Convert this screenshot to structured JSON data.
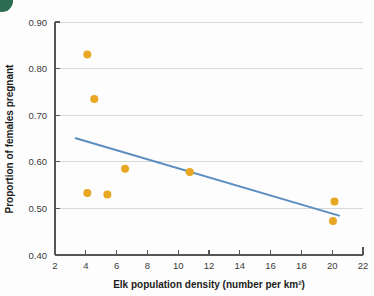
{
  "figure": {
    "corner_marker_color": "#2e6b53",
    "background_color": "#fdfdfd"
  },
  "chart_data": {
    "type": "scatter",
    "title": "",
    "xlabel": "Elk population density (number per km²)",
    "ylabel": "Proportion of females pregnant",
    "xlim": [
      2,
      22
    ],
    "ylim": [
      0.4,
      0.9
    ],
    "xticks": [
      2,
      4,
      6,
      8,
      10,
      12,
      14,
      16,
      18,
      20,
      22
    ],
    "xtick_labels": [
      "2",
      "4",
      "6",
      "8",
      "10",
      "12",
      "14",
      "16",
      "18",
      "20",
      "22"
    ],
    "yticks": [
      0.4,
      0.5,
      0.6,
      0.7,
      0.8,
      0.9
    ],
    "ytick_labels": [
      "0.40",
      "0.50",
      "0.60",
      "0.70",
      "0.80",
      "0.90"
    ],
    "grid": "horizontal",
    "legend": "none",
    "point_color": "#e8a723",
    "point_radius": 4,
    "points": [
      {
        "x": 4.1,
        "y": 0.83
      },
      {
        "x": 4.55,
        "y": 0.735
      },
      {
        "x": 4.1,
        "y": 0.533
      },
      {
        "x": 5.4,
        "y": 0.53
      },
      {
        "x": 6.55,
        "y": 0.585
      },
      {
        "x": 10.75,
        "y": 0.578
      },
      {
        "x": 20.15,
        "y": 0.515
      },
      {
        "x": 20.05,
        "y": 0.473
      }
    ],
    "series": [
      {
        "name": "Elk pregnancy rate",
        "type": "scatter",
        "color": "#e8a723",
        "x": [
          4.1,
          4.55,
          4.1,
          5.4,
          6.55,
          10.75,
          20.15,
          20.05
        ],
        "values": [
          0.83,
          0.735,
          0.533,
          0.53,
          0.585,
          0.578,
          0.515,
          0.473
        ]
      },
      {
        "name": "Linear trend line",
        "type": "line",
        "color": "#5b8dc0",
        "x": [
          3.3,
          20.5
        ],
        "values": [
          0.651,
          0.484
        ]
      }
    ],
    "trend_line": {
      "color": "#5b8dc0",
      "x_start": 3.3,
      "y_start": 0.651,
      "x_end": 20.5,
      "y_end": 0.484
    }
  }
}
